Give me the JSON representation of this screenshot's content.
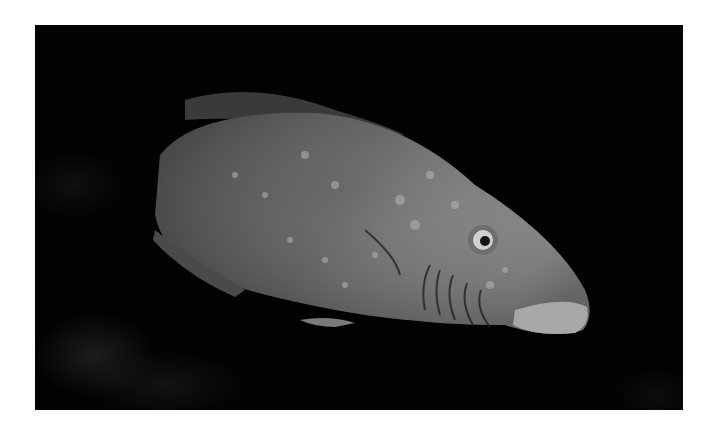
{
  "image": {
    "subject": "fish",
    "alt": "Side view of a large fish with pale spots and dark streaks on its head, against a black background",
    "colors": {
      "border": "#ffffff",
      "background": "#020202",
      "body": "#5a5a5a",
      "head": "#8a8a8a",
      "spots": "#b5b5b5"
    }
  }
}
